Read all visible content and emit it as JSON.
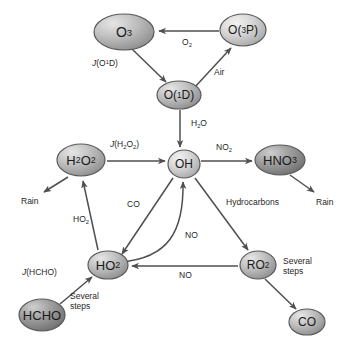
{
  "figure": {
    "kind": "diagram",
    "background_color": "#ffffff",
    "node_fill_light": "#d8d8d8",
    "node_fill_dark": "#8a8a8a",
    "stroke_color": "#4a4a4a",
    "text_color": "#1a1a1a"
  },
  "nodes": [
    {
      "id": "o3",
      "label": "O3",
      "label_html": "O<sub>3</sub>",
      "cx": 124,
      "cy": 32,
      "rx": 30,
      "ry": 18,
      "shade": "mid",
      "font_size": 14
    },
    {
      "id": "o3p",
      "label": "O(3P)",
      "label_html": "O(<sup>3</sup>P)",
      "cx": 243,
      "cy": 30,
      "rx": 23,
      "ry": 16,
      "shade": "light",
      "font_size": 12
    },
    {
      "id": "o1d",
      "label": "O(1D)",
      "label_html": "O(<sup>1</sup>D)",
      "cx": 179,
      "cy": 95,
      "rx": 22,
      "ry": 14,
      "shade": "mid",
      "font_size": 12
    },
    {
      "id": "h2o2",
      "label": "H2O2",
      "label_html": "H<sub>2</sub>O<sub>2</sub>",
      "cx": 81,
      "cy": 160,
      "rx": 24,
      "ry": 16,
      "shade": "mid",
      "font_size": 13
    },
    {
      "id": "oh",
      "label": "OH",
      "label_html": "OH",
      "cx": 184,
      "cy": 164,
      "rx": 16,
      "ry": 14,
      "shade": "light",
      "font_size": 12
    },
    {
      "id": "hno3",
      "label": "HNO3",
      "label_html": "HNO<sub>3</sub>",
      "cx": 280,
      "cy": 160,
      "rx": 25,
      "ry": 15,
      "shade": "dark",
      "font_size": 13
    },
    {
      "id": "ho2",
      "label": "HO2",
      "label_html": "HO<sub>2</sub>",
      "cx": 108,
      "cy": 265,
      "rx": 20,
      "ry": 14,
      "shade": "mid",
      "font_size": 13
    },
    {
      "id": "ro2",
      "label": "RO2",
      "label_html": "RO<sub>2</sub>",
      "cx": 258,
      "cy": 265,
      "rx": 18,
      "ry": 14,
      "shade": "mid",
      "font_size": 12
    },
    {
      "id": "hcho",
      "label": "HCHO",
      "label_html": "HCHO",
      "cx": 42,
      "cy": 315,
      "rx": 23,
      "ry": 16,
      "shade": "dark",
      "font_size": 13
    },
    {
      "id": "co",
      "label": "CO",
      "label_html": "CO",
      "cx": 307,
      "cy": 322,
      "rx": 18,
      "ry": 13,
      "shade": "mid",
      "font_size": 12
    }
  ],
  "edges": [
    {
      "id": "o3p-to-o3",
      "from": "o3p",
      "to": "o3",
      "label": "O2",
      "label_html": "O<sub>2</sub>",
      "label_x": 182,
      "label_y": 37
    },
    {
      "id": "o3-to-o1d",
      "from": "o3",
      "to": "o1d",
      "label": "J(O1D)",
      "label_html": "<span class=\"jv\">J</span>(O<sup>1</sup>D)",
      "label_x": 92,
      "label_y": 57
    },
    {
      "id": "o1d-to-o3p",
      "from": "o1d",
      "to": "o3p",
      "label": "Air",
      "label_html": "Air",
      "label_x": 214,
      "label_y": 67
    },
    {
      "id": "o1d-to-oh",
      "from": "o1d",
      "to": "oh",
      "label": "H2O",
      "label_html": "H<sub>2</sub>O",
      "label_x": 191,
      "label_y": 118
    },
    {
      "id": "h2o2-to-oh",
      "from": "h2o2",
      "to": "oh",
      "label": "J(H2O2)",
      "label_html": "<span class=\"jv\">J</span>(H<sub>2</sub>O<sub>2</sub>)",
      "label_x": 110,
      "label_y": 139
    },
    {
      "id": "oh-to-hno3",
      "from": "oh",
      "to": "hno3",
      "label": "NO2",
      "label_html": "NO<sub>2</sub>",
      "label_x": 216,
      "label_y": 142
    },
    {
      "id": "h2o2-to-rain",
      "from": "h2o2",
      "to": "rain_left",
      "label": "Rain",
      "label_html": "Rain",
      "label_x": 21,
      "label_y": 196
    },
    {
      "id": "hno3-to-rain",
      "from": "hno3",
      "to": "rain_right",
      "label": "Rain",
      "label_html": "Rain",
      "label_x": 316,
      "label_y": 197
    },
    {
      "id": "oh-hydrocarb",
      "from": "oh",
      "to": "ro2",
      "label": "Hydrocarbons",
      "label_html": "Hydrocarbons",
      "label_x": 226,
      "label_y": 197
    },
    {
      "id": "ho2-to-h2o2",
      "from": "ho2",
      "to": "h2o2",
      "label": "HO2",
      "label_html": "HO<sub>2</sub>",
      "label_x": 73,
      "label_y": 214
    },
    {
      "id": "co-to-ho2",
      "from": "oh",
      "to": "ho2",
      "label": "CO",
      "label_html": "CO",
      "label_x": 127,
      "label_y": 199
    },
    {
      "id": "ho2-to-oh",
      "from": "ho2",
      "to": "oh",
      "label": "NO",
      "label_html": "NO",
      "label_x": 185,
      "label_y": 230
    },
    {
      "id": "ro2-to-ho2",
      "from": "ro2",
      "to": "ho2",
      "label": "NO",
      "label_html": "NO",
      "label_x": 179,
      "label_y": 270
    },
    {
      "id": "hcho-to-ho2",
      "from": "hcho",
      "to": "ho2",
      "label": "J(HCHO)",
      "label_html": "<span class=\"jv\">J</span>(HCHO)",
      "label_x": 22,
      "label_y": 267
    },
    {
      "id": "hcho-steps",
      "from": "hcho",
      "to": "ho2",
      "label": "Several steps",
      "label_html": "Several<br>steps",
      "label_x": 70,
      "label_y": 291
    },
    {
      "id": "ro2-steps",
      "from": "ro2",
      "to": "co",
      "label": "Several steps",
      "label_html": "Several<br>steps",
      "label_x": 283,
      "label_y": 256
    }
  ],
  "edge_labels": {
    "o2": "O2",
    "j_o1d": "J(O1D)",
    "air": "Air",
    "h2o": "H2O",
    "j_h2o2": "J(H2O2)",
    "no2": "NO2",
    "rain_left": "Rain",
    "rain_right": "Rain",
    "hydrocarbons": "Hydrocarbons",
    "ho2": "HO2",
    "co": "CO",
    "no_oh": "NO",
    "no_ho2": "NO",
    "j_hcho": "J(HCHO)",
    "several_steps_hcho": "Several steps",
    "several_steps_ro2": "Several steps"
  }
}
